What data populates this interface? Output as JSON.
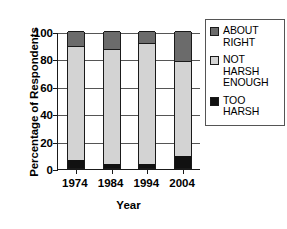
{
  "chart_data": {
    "type": "bar",
    "subtype": "stacked-bar",
    "title": "",
    "xlabel": "Year",
    "ylabel": "Percentage of Respondents",
    "categories": [
      "1974",
      "1984",
      "1994",
      "2004"
    ],
    "ylim": [
      0,
      100
    ],
    "yticks": [
      0,
      20,
      40,
      60,
      80,
      100
    ],
    "ytick_labels": [
      "0",
      "20",
      "40",
      "60",
      "80",
      "100"
    ],
    "grid": true,
    "legend_position": "right",
    "stack_order_bottom_to_top": [
      "TOO HARSH",
      "NOT HARSH ENOUGH",
      "ABOUT RIGHT"
    ],
    "series": [
      {
        "name": "TOO HARSH",
        "color": "#111111",
        "values": [
          6,
          3,
          3,
          9
        ]
      },
      {
        "name": "NOT HARSH ENOUGH",
        "color": "#d3d3d3",
        "values": [
          83,
          84,
          88,
          69
        ]
      },
      {
        "name": "ABOUT RIGHT",
        "color": "#6b6b6b",
        "values": [
          11,
          13,
          9,
          22
        ]
      }
    ],
    "cumulative_tops": {
      "1974": {
        "too_harsh": 6,
        "not_harsh_enough": 89,
        "about_right": 100
      },
      "1984": {
        "too_harsh": 3,
        "not_harsh_enough": 87,
        "about_right": 100
      },
      "1994": {
        "too_harsh": 3,
        "not_harsh_enough": 91,
        "about_right": 100
      },
      "2004": {
        "too_harsh": 9,
        "not_harsh_enough": 78,
        "about_right": 100
      }
    }
  },
  "legend": {
    "entries": [
      {
        "label_lines": [
          "ABOUT",
          "RIGHT"
        ],
        "swatch": "#6b6b6b"
      },
      {
        "label_lines": [
          "NOT",
          "HARSH",
          "ENOUGH"
        ],
        "swatch": "#d3d3d3"
      },
      {
        "label_lines": [
          "TOO",
          "HARSH"
        ],
        "swatch": "#111111"
      }
    ]
  }
}
